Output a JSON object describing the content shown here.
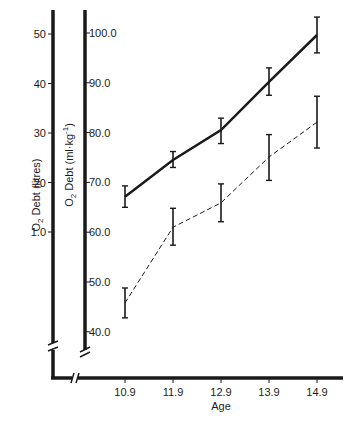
{
  "chart_data": {
    "type": "line",
    "title": "",
    "xlabel": "Age",
    "ylabel_left": "O2 Debt (litres)",
    "ylabel_right": "O2 Debt (ml·kg-1)",
    "x": [
      10.9,
      11.9,
      12.9,
      13.9,
      14.9
    ],
    "x_tick_labels": [
      "10.9",
      "11.9",
      "12.9",
      "13.9",
      "14.9"
    ],
    "left_axis": {
      "ticks": [
        10,
        20,
        30,
        40,
        50
      ],
      "tick_labels": [
        "1.0",
        "20",
        "30",
        "40",
        "50"
      ],
      "range": [
        0,
        54
      ],
      "broken": true
    },
    "right_axis": {
      "ticks": [
        40,
        50,
        60,
        70,
        80,
        90,
        100
      ],
      "tick_labels": [
        "40.0",
        "50.0",
        "60.0",
        "70.0",
        "80.0",
        "90.0",
        "100.0"
      ],
      "range": [
        36,
        104
      ],
      "broken": true
    },
    "series": [
      {
        "name": "solid",
        "style": "solid",
        "axis": "right",
        "values": [
          67.1,
          74.5,
          80.5,
          90.2,
          99.6
        ],
        "error_low": [
          65.0,
          73.0,
          77.8,
          87.5,
          96.0
        ],
        "error_high": [
          69.3,
          76.2,
          82.9,
          93.0,
          103.2
        ]
      },
      {
        "name": "dashed",
        "style": "dashed",
        "axis": "right",
        "values": [
          45.8,
          61.0,
          65.9,
          75.1,
          82.1
        ],
        "error_low": [
          42.8,
          57.4,
          62.1,
          70.4,
          76.9
        ],
        "error_high": [
          48.8,
          64.8,
          69.7,
          79.6,
          87.3
        ]
      }
    ],
    "grid": false,
    "legend": "none"
  },
  "labels": {
    "x_title": "Age",
    "left_title_main": "O",
    "left_title_sub": "2",
    "left_title_rest": " Debt  (litres)",
    "right_title_main": "O",
    "right_title_sub": "2",
    "right_title_rest": " Debt  (ml·kg",
    "right_title_sup": "-1",
    "right_title_end": ")"
  },
  "colors": {
    "ink": "#1a1a1a",
    "background": "#ffffff"
  }
}
